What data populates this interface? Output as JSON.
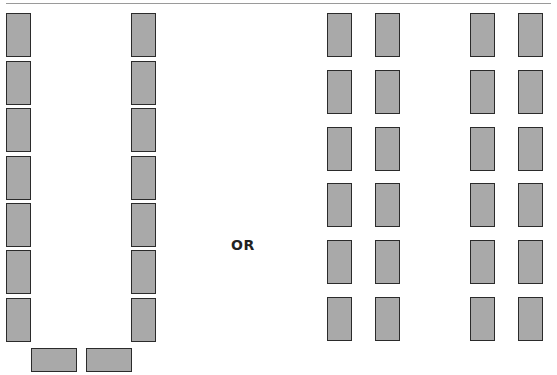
{
  "separator_label": "OR",
  "layouts": [
    {
      "name": "u-shape",
      "left_column_x": 6,
      "right_column_x": 131,
      "rows_y": [
        13,
        61,
        108,
        156,
        203,
        250,
        298
      ],
      "bottom_desks": [
        {
          "x": 31,
          "y": 348
        },
        {
          "x": 86,
          "y": 348
        }
      ]
    },
    {
      "name": "paired-rows",
      "columns_x": [
        327,
        375,
        470,
        518
      ],
      "rows_y": [
        13,
        70,
        127,
        183,
        240,
        297
      ]
    }
  ],
  "colors": {
    "desk_fill": "#a9a9a9",
    "desk_border": "#2b2b2b",
    "rule": "#9a9a9a"
  }
}
